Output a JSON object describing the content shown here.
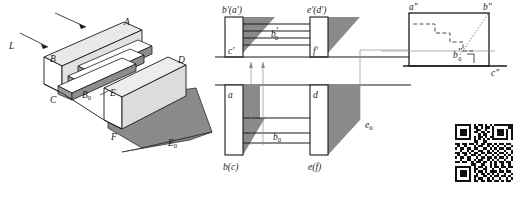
{
  "figure": {
    "background_color": "#ffffff",
    "line_color": "#1a1a1a",
    "shadow_fill": "#8a8a8a",
    "light_face_fill": "#e6e6e6",
    "mid_face_fill": "#cfcfcf",
    "dark_face_fill": "#9a9a9a",
    "white_fill": "#ffffff"
  },
  "pictorial": {
    "name": "isometric-stepped-block",
    "light_ray_label": "L",
    "vertex_labels": [
      {
        "id": "A",
        "text": "A"
      },
      {
        "id": "B",
        "text": "B"
      },
      {
        "id": "C",
        "text": "C"
      },
      {
        "id": "D",
        "text": "D"
      },
      {
        "id": "E",
        "text": "E"
      },
      {
        "id": "F",
        "text": "F"
      }
    ],
    "step_label": "B",
    "step_label_sub": "0",
    "shadow_label": "E",
    "shadow_label_sub": "0"
  },
  "front_view": {
    "name": "front-view",
    "labels": [
      {
        "id": "ba-prime",
        "text": "b′(a′)"
      },
      {
        "id": "ed-prime",
        "text": "e′(d′)"
      },
      {
        "id": "c-prime",
        "text": "c′"
      },
      {
        "id": "f-prime",
        "text": "f′"
      }
    ],
    "shadow_point": {
      "base": "b",
      "prime": "′",
      "sub": "0"
    }
  },
  "top_view": {
    "name": "top-view",
    "labels": [
      {
        "id": "a",
        "text": "a"
      },
      {
        "id": "d",
        "text": "d"
      },
      {
        "id": "bc",
        "text": "b(c)"
      },
      {
        "id": "ef",
        "text": "e(f)"
      }
    ],
    "shadow_point": {
      "base": "b",
      "sub": "0"
    },
    "shadow_edge": {
      "base": "e",
      "sub": "0"
    }
  },
  "side_view": {
    "name": "side-view",
    "labels": [
      {
        "id": "a-dprime",
        "text": "a″"
      },
      {
        "id": "b-dprime",
        "text": "b″"
      },
      {
        "id": "c-dprime",
        "text": "c″"
      }
    ],
    "shadow_point": {
      "base": "b",
      "dprime": "″",
      "sub": "0"
    },
    "has_dashed_staircase": true,
    "has_right_angle_mark": true
  },
  "qr_code": {
    "name": "qr-code",
    "alt": "qr-code",
    "modules": 25,
    "bits": [
      "1111111010110101011111111",
      "1000001011010110100000011",
      "1011101001100100101110101",
      "1011101011011010101110101",
      "1011101000101100101110101",
      "1000001010110101100000101",
      "1111111010101010111111101",
      "0000000011001100000000000",
      "1101101101011011010110110",
      "0100100010110010101001001",
      "1011011011001101010110110",
      "0010010100110010101001001",
      "1101101011011011010110101",
      "0100100110100100101001010",
      "1011011001011011010110101",
      "0010011010110010101001001",
      "1101100101101101010110110",
      "0000000110011001010010010",
      "1111111010110101011011011",
      "1000001011001100100100100",
      "1011101010110101110110110",
      "1011101001011010101001001",
      "1011101011001101011011010",
      "1000001010110010100100101",
      "1111111011011011011010110"
    ]
  }
}
